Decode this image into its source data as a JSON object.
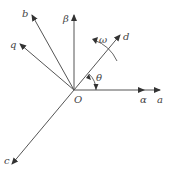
{
  "diagram": {
    "origin_label": "O",
    "axes": [
      {
        "id": "a",
        "label": "a"
      },
      {
        "id": "alpha",
        "label": "α"
      },
      {
        "id": "b",
        "label": "b"
      },
      {
        "id": "beta",
        "label": "β"
      },
      {
        "id": "c",
        "label": "c"
      },
      {
        "id": "d",
        "label": "d"
      },
      {
        "id": "q",
        "label": "q"
      }
    ],
    "angle_label": "θ",
    "rotation_label": "ω",
    "colors": {
      "line": "#555555",
      "text": "#444444",
      "background": "#ffffff"
    }
  }
}
